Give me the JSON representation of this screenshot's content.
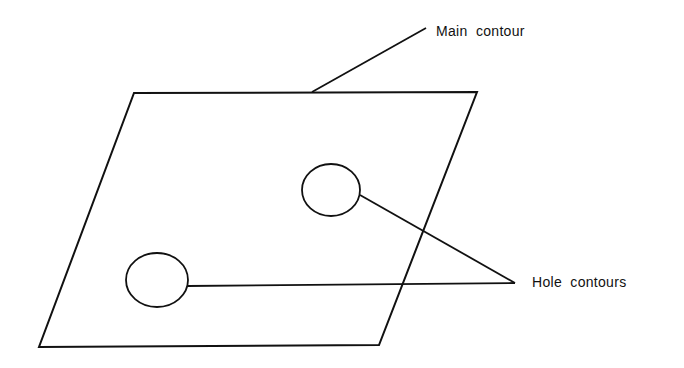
{
  "diagram": {
    "type": "contour-diagram",
    "stroke_color": "#111111",
    "background": "#ffffff",
    "labels": {
      "main_contour": "Main  contour",
      "hole_contours": "Hole  contours"
    },
    "main_contour": {
      "shape": "parallelogram",
      "points": [
        [
          134,
          93
        ],
        [
          477,
          92
        ],
        [
          379,
          345
        ],
        [
          39,
          347
        ]
      ]
    },
    "holes": [
      {
        "name": "upper-hole",
        "cx": 331,
        "cy": 190,
        "rx": 29,
        "ry": 26
      },
      {
        "name": "lower-hole",
        "cx": 157,
        "cy": 280,
        "rx": 31,
        "ry": 27
      }
    ],
    "leaders": [
      {
        "target": "main_contour",
        "from": [
          312,
          92
        ],
        "to": [
          426,
          28
        ]
      },
      {
        "target": "upper-hole",
        "from": [
          360,
          195
        ],
        "to": [
          515,
          283
        ]
      },
      {
        "target": "lower-hole",
        "from": [
          188,
          286
        ],
        "to": [
          515,
          283
        ]
      }
    ]
  }
}
